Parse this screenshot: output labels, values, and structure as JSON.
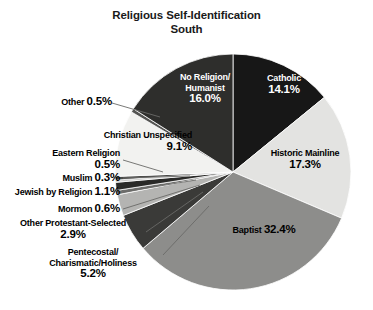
{
  "title": {
    "line1": "Religious Self-Identification",
    "line2": "South"
  },
  "chart_data": {
    "type": "pie",
    "title": "Religious Self-Identification South",
    "subtitle": "South",
    "legend": "none",
    "labels_position": "inside-and-callout",
    "categories": [
      "Catholic",
      "Historic Mainline",
      "Baptist",
      "Pentecostal/Charismatic/Holiness",
      "Other Protestant-Selected",
      "Mormon",
      "Jewish by Religion",
      "Muslim",
      "Eastern Religion",
      "Christian Unspecified",
      "Other",
      "No Religion/Humanist"
    ],
    "values": [
      14.1,
      17.3,
      32.4,
      5.2,
      2.9,
      0.6,
      1.1,
      0.3,
      0.5,
      9.1,
      0.5,
      16.0
    ],
    "units": "percent",
    "total": 100.0,
    "start_angle_deg": 0,
    "direction": "clockwise",
    "slices": [
      {
        "name": "Catholic",
        "value": 14.1,
        "label": "Catholic",
        "pct_text": "14.1%",
        "color": "#171717",
        "text_color": "#ffffff",
        "label_style": "inside"
      },
      {
        "name": "Historic Mainline",
        "value": 17.3,
        "label": "Historic Mainline",
        "pct_text": "17.3%",
        "color": "#e3e3e1",
        "text_color": "#000000",
        "label_style": "inside"
      },
      {
        "name": "Baptist",
        "value": 32.4,
        "label": "Baptist",
        "pct_text": "32.4%",
        "color": "#8d8d8b",
        "text_color": "#000000",
        "label_style": "inside"
      },
      {
        "name": "Pentecostal/Charismatic/Holiness",
        "value": 5.2,
        "label": "Pentecostal/\nCharismatic/Holiness",
        "pct_text": "5.2%",
        "color": "#3a3a38",
        "text_color": "#000000",
        "label_style": "callout"
      },
      {
        "name": "Other Protestant-Selected",
        "value": 2.9,
        "label": "Other Protestant-Selected",
        "pct_text": "2.9%",
        "color": "#b4b4b2",
        "text_color": "#000000",
        "label_style": "callout"
      },
      {
        "name": "Mormon",
        "value": 0.6,
        "label": "Mormon",
        "pct_text": "0.6%",
        "color": "#6e6e6c",
        "text_color": "#000000",
        "label_style": "callout"
      },
      {
        "name": "Jewish by Religion",
        "value": 1.1,
        "label": "Jewish by Religion",
        "pct_text": "1.1%",
        "color": "#2a2a28",
        "text_color": "#000000",
        "label_style": "callout"
      },
      {
        "name": "Muslim",
        "value": 0.3,
        "label": "Muslim",
        "pct_text": "0.3%",
        "color": "#c9c9c7",
        "text_color": "#000000",
        "label_style": "callout"
      },
      {
        "name": "Eastern Religion",
        "value": 0.5,
        "label": "Eastern Religion",
        "pct_text": "0.5%",
        "color": "#4a4a48",
        "text_color": "#000000",
        "label_style": "callout"
      },
      {
        "name": "Christian Unspecified",
        "value": 9.1,
        "label": "Christian Unspecified",
        "pct_text": "9.1%",
        "color": "#f2f2f0",
        "text_color": "#000000",
        "label_style": "inside"
      },
      {
        "name": "Other",
        "value": 0.5,
        "label": "Other",
        "pct_text": "0.5%",
        "color": "#555553",
        "text_color": "#000000",
        "label_style": "callout"
      },
      {
        "name": "No Religion/Humanist",
        "value": 16.0,
        "label": "No Religion/\nHumanist",
        "pct_text": "16.0%",
        "color": "#2e2e2c",
        "text_color": "#ffffff",
        "label_style": "inside"
      }
    ]
  },
  "labels": {
    "catholic": {
      "name": "Catholic",
      "pct": "14.1%"
    },
    "historic_mainline": {
      "name": "Historic Mainline",
      "pct": "17.3%"
    },
    "baptist": {
      "name": "Baptist",
      "pct": "32.4%"
    },
    "no_religion_l1": "No Religion/",
    "no_religion_l2": "Humanist",
    "no_religion_pct": "16.0%",
    "christian_unspec": {
      "name": "Christian Unspecified",
      "pct": "9.1%"
    },
    "other": {
      "name": "Other",
      "pct": "0.5%"
    },
    "eastern_l1": "Eastern Religion",
    "eastern_pct": "0.5%",
    "muslim": {
      "name": "Muslim",
      "pct": "0.3%"
    },
    "jewish": {
      "name": "Jewish by Religion",
      "pct": "1.1%"
    },
    "mormon": {
      "name": "Mormon",
      "pct": "0.6%"
    },
    "other_protestant_l1": "Other Protestant-Selected",
    "other_protestant_pct": "2.9%",
    "pentecostal_l1": "Pentecostal/",
    "pentecostal_l2": "Charismatic/Holiness",
    "pentecostal_pct": "5.2%"
  },
  "geometry": {
    "cx": 233,
    "cy": 172,
    "r": 118
  },
  "colors": {
    "background": "#ffffff",
    "outline": "#ffffff",
    "leader_line": "#6a6a68"
  }
}
